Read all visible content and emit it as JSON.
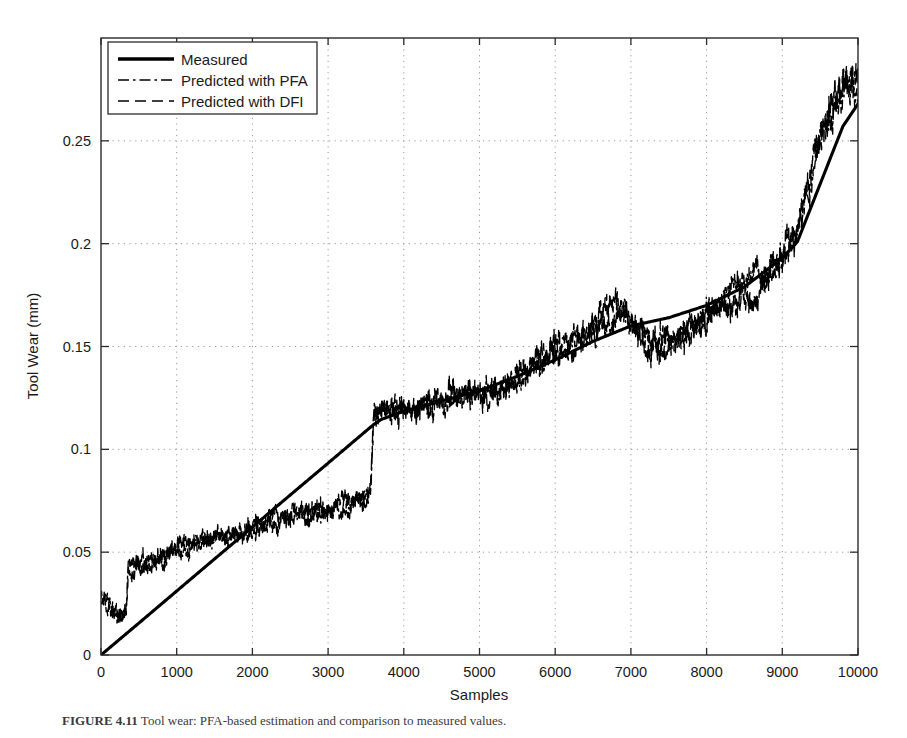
{
  "figure": {
    "caption_prefix": "FIGURE 4.11",
    "caption_body": "Tool wear: PFA-based estimation and comparison to measured values."
  },
  "chart_data": {
    "type": "line",
    "title": "",
    "xlabel": "Samples",
    "ylabel": "Tool Wear (mm)",
    "xlim": [
      0,
      10000
    ],
    "ylim": [
      0,
      0.3
    ],
    "xticks": [
      0,
      1000,
      2000,
      3000,
      4000,
      5000,
      6000,
      7000,
      8000,
      9000,
      10000
    ],
    "xticklabels": [
      "0",
      "1000",
      "2000",
      "3000",
      "4000",
      "5000",
      "6000",
      "7000",
      "8000",
      "9000",
      "10000"
    ],
    "yticks": [
      0,
      0.05,
      0.1,
      0.15,
      0.2,
      0.25
    ],
    "yticklabels": [
      "0",
      "0.05",
      "0.1",
      "0.15",
      "0.2",
      "0.25"
    ],
    "grid": true,
    "grid_style": "dotted",
    "legend_position": "upper-left",
    "legend": [
      {
        "label": "Measured",
        "style": "solid",
        "color": "#000000"
      },
      {
        "label": "Predicted with PFA",
        "style": "dashdot",
        "color": "#000000"
      },
      {
        "label": "Predicted with DFI",
        "style": "dashed",
        "color": "#000000"
      }
    ],
    "series": [
      {
        "name": "Measured",
        "style": "solid",
        "comment": "Piecewise-linear measured tool wear: ramps 0 to 0.112 over samples 0-3600, resets and rises smoothly to 0.285 at 10000.",
        "x": [
          0,
          500,
          1000,
          1500,
          2000,
          2500,
          3000,
          3500,
          3600,
          3700,
          4000,
          4500,
          5000,
          5500,
          6000,
          6500,
          7000,
          7500,
          8000,
          8500,
          9000,
          9200,
          9500,
          9800,
          10000
        ],
        "y": [
          0.0,
          0.0155,
          0.0311,
          0.0467,
          0.0622,
          0.0778,
          0.0933,
          0.1089,
          0.112,
          0.1145,
          0.1185,
          0.1235,
          0.1285,
          0.1355,
          0.1435,
          0.1525,
          0.16,
          0.164,
          0.17,
          0.179,
          0.193,
          0.201,
          0.229,
          0.257,
          0.268
        ]
      },
      {
        "name": "Predicted with PFA",
        "style": "dashdot",
        "comment": "Noisy estimate; starts ~0.026, dips to ~0.018 near sample 250, steps up to ~0.042 at ~350, climbs to ~0.077 by 3550, jumps to ~0.117 at 3600, drifts with noise to ~0.20 by 9200, then steep rise to ~0.28.",
        "x": [
          0,
          100,
          200,
          250,
          300,
          340,
          360,
          500,
          800,
          1200,
          1600,
          2000,
          2400,
          2800,
          3200,
          3500,
          3560,
          3600,
          3700,
          4000,
          4400,
          4800,
          5200,
          5600,
          6000,
          6400,
          6800,
          7000,
          7200,
          7500,
          7800,
          8100,
          8400,
          8700,
          9000,
          9200,
          9400,
          9600,
          9800,
          10000
        ],
        "y": [
          0.026,
          0.024,
          0.02,
          0.018,
          0.019,
          0.021,
          0.042,
          0.044,
          0.047,
          0.052,
          0.057,
          0.061,
          0.065,
          0.069,
          0.073,
          0.076,
          0.077,
          0.117,
          0.118,
          0.12,
          0.122,
          0.124,
          0.128,
          0.136,
          0.145,
          0.156,
          0.168,
          0.159,
          0.153,
          0.156,
          0.163,
          0.17,
          0.178,
          0.186,
          0.196,
          0.205,
          0.232,
          0.258,
          0.272,
          0.279
        ]
      },
      {
        "name": "Predicted with DFI",
        "style": "dashed",
        "comment": "Second noisy estimate tracking the PFA trace closely; diverges modestly between samples 6900-8400 staying lower, and overshoots near 9600-10000.",
        "x": [
          0,
          100,
          200,
          250,
          300,
          340,
          360,
          500,
          800,
          1200,
          1600,
          2000,
          2400,
          2800,
          3200,
          3500,
          3560,
          3600,
          3700,
          4000,
          4400,
          4800,
          5200,
          5600,
          6000,
          6400,
          6800,
          7000,
          7200,
          7500,
          7800,
          8100,
          8400,
          8700,
          9000,
          9200,
          9400,
          9600,
          9800,
          10000
        ],
        "y": [
          0.027,
          0.023,
          0.019,
          0.018,
          0.02,
          0.022,
          0.041,
          0.045,
          0.048,
          0.053,
          0.058,
          0.062,
          0.066,
          0.07,
          0.074,
          0.077,
          0.078,
          0.116,
          0.119,
          0.121,
          0.123,
          0.126,
          0.13,
          0.138,
          0.147,
          0.158,
          0.172,
          0.162,
          0.15,
          0.152,
          0.158,
          0.164,
          0.17,
          0.18,
          0.192,
          0.202,
          0.238,
          0.266,
          0.281,
          0.285
        ]
      }
    ]
  }
}
